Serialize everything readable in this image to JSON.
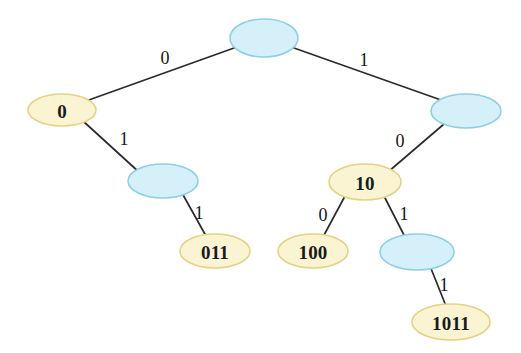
{
  "diagram": {
    "type": "binary-tree",
    "background_color": "#ffffff",
    "colors": {
      "internal_node_fill": "#d6f0f9",
      "internal_node_stroke": "#8ecfe6",
      "codeword_node_fill": "#fbf4d2",
      "codeword_node_stroke": "#e4d286",
      "edge_stroke": "#2b2b2f",
      "text_color": "#1a1a1a"
    },
    "nodes": [
      {
        "id": "root",
        "label": "",
        "kind": "internal",
        "cx": 264,
        "cy": 38,
        "rx": 34,
        "ry": 19
      },
      {
        "id": "n0",
        "label": "0",
        "kind": "codeword",
        "cx": 62,
        "cy": 110,
        "rx": 34,
        "ry": 16
      },
      {
        "id": "n1",
        "label": "",
        "kind": "internal",
        "cx": 466,
        "cy": 111,
        "rx": 35,
        "ry": 17
      },
      {
        "id": "n01",
        "label": "",
        "kind": "internal",
        "cx": 163,
        "cy": 181,
        "rx": 35,
        "ry": 17
      },
      {
        "id": "n10",
        "label": "10",
        "kind": "codeword",
        "cx": 365,
        "cy": 182,
        "rx": 36,
        "ry": 18
      },
      {
        "id": "n011",
        "label": "011",
        "kind": "codeword",
        "cx": 215,
        "cy": 251,
        "rx": 35,
        "ry": 17
      },
      {
        "id": "n100",
        "label": "100",
        "kind": "codeword",
        "cx": 313,
        "cy": 251,
        "rx": 35,
        "ry": 17
      },
      {
        "id": "n101",
        "label": "",
        "kind": "internal",
        "cx": 417,
        "cy": 252,
        "rx": 37,
        "ry": 18
      },
      {
        "id": "n1011",
        "label": "1011",
        "kind": "codeword",
        "cx": 451,
        "cy": 322,
        "rx": 39,
        "ry": 18
      }
    ],
    "edges": [
      {
        "from": "root",
        "to": "n0",
        "bit": "0",
        "x1": 234,
        "y1": 48,
        "x2": 86,
        "y2": 101,
        "lx": 165,
        "ly": 58
      },
      {
        "from": "root",
        "to": "n1",
        "bit": "1",
        "x1": 294,
        "y1": 48,
        "x2": 441,
        "y2": 100,
        "lx": 364,
        "ly": 60
      },
      {
        "from": "n0",
        "to": "n01",
        "bit": "1",
        "x1": 83,
        "y1": 121,
        "x2": 140,
        "y2": 173,
        "lx": 124,
        "ly": 139
      },
      {
        "from": "n1",
        "to": "n10",
        "bit": "0",
        "x1": 444,
        "y1": 124,
        "x2": 388,
        "y2": 172,
        "lx": 400,
        "ly": 141
      },
      {
        "from": "n01",
        "to": "n011",
        "bit": "1",
        "x1": 182,
        "y1": 193,
        "x2": 206,
        "y2": 236,
        "lx": 199,
        "ly": 213
      },
      {
        "from": "n10",
        "to": "n100",
        "bit": "0",
        "x1": 345,
        "y1": 196,
        "x2": 323,
        "y2": 237,
        "lx": 323,
        "ly": 215
      },
      {
        "from": "n10",
        "to": "n101",
        "bit": "1",
        "x1": 384,
        "y1": 196,
        "x2": 405,
        "y2": 237,
        "lx": 404,
        "ly": 214
      },
      {
        "from": "n101",
        "to": "n1011",
        "bit": "1",
        "x1": 430,
        "y1": 266,
        "x2": 446,
        "y2": 306,
        "lx": 444,
        "ly": 285
      }
    ]
  }
}
